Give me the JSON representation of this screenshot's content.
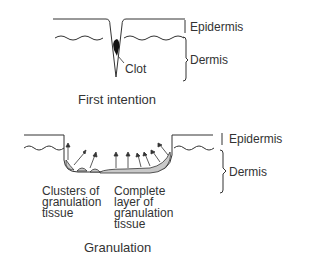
{
  "diagram_top": {
    "labels": {
      "epidermis": "Epidermis",
      "dermis": "Dermis",
      "clot": "Clot"
    },
    "title": "First intention"
  },
  "diagram_bottom": {
    "labels": {
      "epidermis": "Epidermis",
      "dermis": "Dermis",
      "clusters": "Clusters of\ngranulation\ntissue",
      "complete": "Complete\nlayer of\ngranulation\ntissue"
    },
    "title": "Granulation"
  },
  "colors": {
    "line": "#333333",
    "tissue_fill": "#c8c8c8"
  }
}
